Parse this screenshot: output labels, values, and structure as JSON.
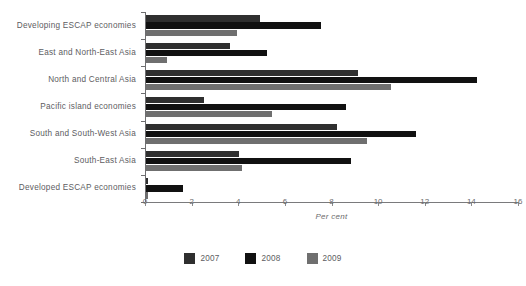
{
  "chart_data": {
    "type": "bar",
    "orientation": "horizontal",
    "title": "",
    "xlabel": "Per cent",
    "ylabel": "",
    "xlim": [
      0,
      16
    ],
    "xticks": [
      0,
      2,
      4,
      6,
      8,
      10,
      12,
      14,
      16
    ],
    "grid": false,
    "legend_position": "bottom",
    "categories": [
      "Developing ESCAP economies",
      "East and North-East Asia",
      "North and Central Asia",
      "Pacific island economies",
      "South and South-West Asia",
      "South-East Asia",
      "Developed ESCAP economies"
    ],
    "series": [
      {
        "name": "2007",
        "color": "#2f2f2f",
        "values": [
          4.9,
          3.6,
          9.1,
          2.5,
          8.2,
          4.0,
          0.1
        ]
      },
      {
        "name": "2008",
        "color": "#111111",
        "values": [
          7.5,
          5.2,
          14.2,
          8.6,
          11.6,
          8.8,
          1.6
        ]
      },
      {
        "name": "2009",
        "color": "#6f6f6f",
        "values": [
          3.9,
          0.9,
          10.5,
          5.4,
          9.5,
          4.1,
          0.1
        ]
      }
    ]
  },
  "legend": {
    "items": [
      {
        "label": "2007",
        "color": "#2f2f2f"
      },
      {
        "label": "2008",
        "color": "#111111"
      },
      {
        "label": "2009",
        "color": "#6f6f6f"
      }
    ]
  },
  "axis": {
    "x_title": "Per cent",
    "tick_labels": [
      "0",
      "2",
      "4",
      "6",
      "8",
      "10",
      "12",
      "14",
      "16"
    ]
  }
}
